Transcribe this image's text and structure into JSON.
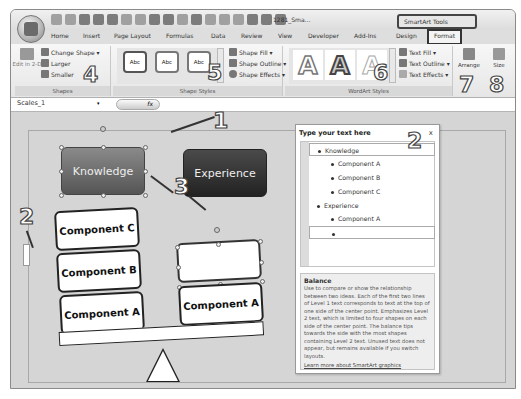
{
  "titlebar": {
    "document_title": "1281_Sma...",
    "contextual_tools": "SmartArt Tools"
  },
  "tabs": [
    {
      "label": "Home"
    },
    {
      "label": "Insert"
    },
    {
      "label": "Page Layout"
    },
    {
      "label": "Formulas"
    },
    {
      "label": "Data"
    },
    {
      "label": "Review"
    },
    {
      "label": "View"
    },
    {
      "label": "Developer"
    },
    {
      "label": "Add-Ins"
    },
    {
      "label": "Design"
    },
    {
      "label": "Format"
    }
  ],
  "ribbon": {
    "shapes_group": {
      "label": "Shapes",
      "edit_3d": "Edit in 2-D",
      "change_shape": "Change Shape ▾",
      "larger": "Larger",
      "smaller": "Smaller"
    },
    "shape_styles_group": {
      "label": "Shape Styles",
      "styles": [
        "Abc",
        "Abc",
        "Abc"
      ],
      "shape_fill": "Shape Fill ▾",
      "shape_outline": "Shape Outline ▾",
      "shape_effects": "Shape Effects ▾"
    },
    "wordart_group": {
      "label": "WordArt Styles",
      "styles": [
        "A",
        "A",
        "A"
      ],
      "text_fill": "Text Fill ▾",
      "text_outline": "Text Outline ▾",
      "text_effects": "Text Effects ▾"
    },
    "arrange": {
      "label": "Arrange"
    },
    "size": {
      "label": "Size"
    }
  },
  "formula_bar": {
    "name_box": "Scales_1",
    "fx": "fx"
  },
  "diagram": {
    "level1": [
      "Knowledge",
      "Experience"
    ],
    "left_components": [
      "Component C",
      "Component B",
      "Component A"
    ],
    "right_components": [
      "",
      "Component A"
    ]
  },
  "text_pane": {
    "title": "Type your text here",
    "close": "x",
    "items": [
      {
        "level": 1,
        "text": "Knowledge"
      },
      {
        "level": 2,
        "text": "Component A"
      },
      {
        "level": 2,
        "text": "Component B"
      },
      {
        "level": 2,
        "text": "Component C"
      },
      {
        "level": 1,
        "text": "Experience"
      },
      {
        "level": 2,
        "text": "Component A"
      },
      {
        "level": 2,
        "text": ""
      }
    ],
    "description_title": "Balance",
    "description": "Use to compare or show the relationship between two ideas. Each of the first two lines of Level 1 text corresponds to text at the top of one side of the center point. Emphasizes Level 2 text, which is limited to four shapes on each side of the center point. The balance tips towards the side with the most shapes containing Level 2 text. Unused text does not appear, but remains available if you switch layouts.",
    "learn_more": "Learn more about SmartArt graphics"
  },
  "callouts": [
    "1",
    "2",
    "2",
    "3",
    "4",
    "5",
    "6",
    "7",
    "8"
  ],
  "colors": {
    "knowledge_fill": "#6e6e6e",
    "experience_fill": "#333333",
    "canvas": "#d5d5d5"
  }
}
